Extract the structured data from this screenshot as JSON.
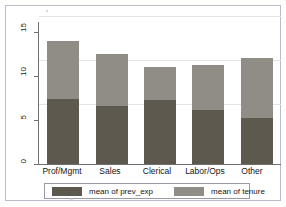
{
  "chart_data": {
    "type": "bar",
    "subtype": "stacked-bar",
    "title": "",
    "xlabel": "",
    "ylabel": "",
    "categories": [
      "Prof/Mgmt",
      "Sales",
      "Clerical",
      "Labor/Ops",
      "Other"
    ],
    "series": [
      {
        "name": "mean of prev_exp",
        "color": "#5d594f",
        "values": [
          7.4,
          6.6,
          7.3,
          6.1,
          5.2
        ]
      },
      {
        "name": "mean of tenure",
        "color": "#8f8d86",
        "values": [
          6.6,
          5.9,
          3.7,
          5.1,
          6.9
        ]
      }
    ],
    "totals": [
      14.0,
      12.5,
      11.0,
      11.2,
      12.1
    ],
    "yticks": [
      0,
      5,
      10,
      15
    ],
    "ytick_labels": [
      "0",
      "5",
      "10",
      "15"
    ],
    "ylim": [
      0,
      16
    ],
    "grid": true,
    "grid_axis": "y",
    "legend_position": "bottom",
    "legend": [
      "mean of prev_exp",
      "mean of tenure"
    ]
  },
  "axis": {
    "y_tick_0": "0",
    "y_tick_5": "5",
    "y_tick_10": "10",
    "y_tick_15": "15"
  },
  "legend": {
    "entry_1_label": "mean of prev_exp",
    "entry_2_label": "mean of tenure",
    "entry_1_color": "#5d594f",
    "entry_2_color": "#8f8d86"
  }
}
